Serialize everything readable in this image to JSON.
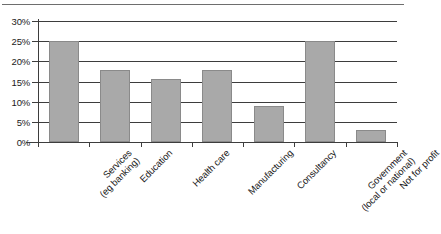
{
  "chart_data": {
    "type": "bar",
    "title": "",
    "subtitle": "",
    "xlabel": "",
    "ylabel": "",
    "ylim": [
      0,
      30
    ],
    "ytick_step": 5,
    "ytick_labels": [
      "0%",
      "5%",
      "10%",
      "15%",
      "20%",
      "25%",
      "30%"
    ],
    "ytick_values": [
      0,
      5,
      10,
      15,
      20,
      25,
      30
    ],
    "grid": true,
    "grid_axis": "y",
    "legend": false,
    "legend_position": "none",
    "value_unit": "%",
    "categories": [
      "Services (eg banking)",
      "Education",
      "Health care",
      "Manufacturing",
      "Consultancy",
      "Government (local or national)",
      "Not for profit"
    ],
    "category_lines": [
      [
        "Services",
        "(eg banking)"
      ],
      [
        "Education",
        ""
      ],
      [
        "Health care",
        ""
      ],
      [
        "Manufacturing",
        ""
      ],
      [
        "Consultancy",
        ""
      ],
      [
        "Government",
        "(local or national)"
      ],
      [
        "Not for profit",
        ""
      ]
    ],
    "values": [
      25.0,
      17.8,
      15.5,
      17.8,
      8.9,
      25.0,
      2.9
    ],
    "series": [
      {
        "name": "Share of respondents",
        "values": [
          25.0,
          17.8,
          15.5,
          17.8,
          8.9,
          25.0,
          2.9
        ]
      }
    ],
    "colors": {
      "bar_fill": "#a9a9a9",
      "bar_border": "#8a8a8a",
      "axis": "#3d3d3d",
      "grid": "#3d3d3d",
      "text": "#1a1a1a",
      "background": "#ffffff"
    }
  }
}
